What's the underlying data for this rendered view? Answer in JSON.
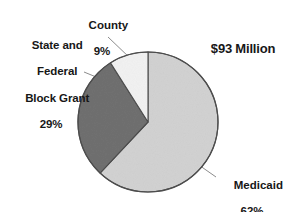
{
  "chart_data": {
    "type": "pie",
    "title": "",
    "subtitle": "",
    "total_label": "$93 Million",
    "total_value": 93,
    "total_units": "Million",
    "categories": [
      "Medicaid",
      "State and Federal Block Grant",
      "County"
    ],
    "values": [
      62,
      29,
      9
    ],
    "value_unit": "%",
    "start_angle_deg": 0,
    "direction": "clockwise",
    "legend_position": "none",
    "labels_position": "outside-with-leader-lines",
    "grid": false,
    "slices": [
      {
        "name": "Medicaid",
        "label": "Medicaid",
        "percent": 62,
        "percent_label": "62%",
        "color": "#d2d2d2",
        "stroke": "#4d4d4d"
      },
      {
        "name": "State and Federal Block Grant",
        "label": "State and\nFederal\nBlock Grant",
        "label_lines": [
          "State and",
          "Federal",
          "Block Grant"
        ],
        "percent": 29,
        "percent_label": "29%",
        "color": "#707070",
        "stroke": "#4d4d4d"
      },
      {
        "name": "County",
        "label": "County",
        "percent": 9,
        "percent_label": "9%",
        "color": "#f2f2f2",
        "stroke": "#4d4d4d"
      }
    ]
  },
  "labels": {
    "block_grant_line1": "State and",
    "block_grant_line2": "Federal",
    "block_grant_line3": "Block Grant",
    "block_grant_pct": "29%",
    "county_name": "County",
    "county_pct": "9%",
    "medicaid_name": "Medicaid",
    "medicaid_pct": "62%",
    "total": "$93 Million"
  },
  "colors": {
    "background": "#ffffff",
    "text": "#171717",
    "slice_medicaid": "#d2d2d2",
    "slice_block_grant": "#707070",
    "slice_county": "#f2f2f2",
    "outline": "#4d4d4d",
    "leader_line": "#8c8c8c"
  }
}
